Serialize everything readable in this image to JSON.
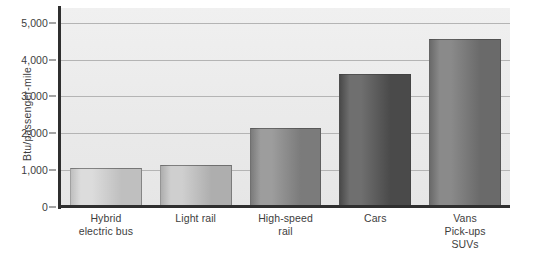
{
  "chart_data": {
    "type": "bar",
    "title": "",
    "xlabel": "",
    "ylabel": "Btu/passenger-mile",
    "categories": [
      "Hybrid electric bus",
      "Light rail",
      "High-speed rail",
      "Cars",
      "Vans Pick-ups SUVs"
    ],
    "category_lines": [
      [
        "Hybrid",
        "electric bus"
      ],
      [
        "Light rail"
      ],
      [
        "High-speed",
        "rail"
      ],
      [
        "Cars"
      ],
      [
        "Vans",
        "Pick-ups",
        "SUVs"
      ]
    ],
    "values": [
      1050,
      1150,
      2150,
      3600,
      4550
    ],
    "ylim": [
      0,
      5400
    ],
    "yticks": [
      0,
      1000,
      2000,
      3000,
      4000,
      5000
    ],
    "ytick_labels": [
      "0",
      "1,000",
      "2,000",
      "3,000",
      "4,000",
      "5,000"
    ],
    "grid": true,
    "legend": "none",
    "bar_colors": [
      "#dcdcdc",
      "#cfcfcf",
      "#9d9d9d",
      "#6f6f6f",
      "#8a8a8a"
    ],
    "bar_colors_dark": [
      "#bfbfbf",
      "#aeaeae",
      "#7b7b7b",
      "#4a4a4a",
      "#6a6a6a"
    ],
    "panel_color": "#ebebeb",
    "axis_color": "#2f2f2f",
    "grid_color": "#b4b4b4"
  },
  "footer": {
    "credit": ""
  }
}
